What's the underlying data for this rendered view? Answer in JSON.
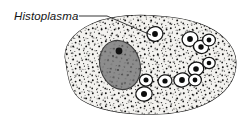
{
  "figure": {
    "kind": "biology-illustration",
    "background_color": "#ffffff"
  },
  "annotation": {
    "label": "Histoplasma",
    "label_style": "italic",
    "label_color": "#141414",
    "label_x": 14,
    "label_baseline_y": 20,
    "leader_line": {
      "name": "leader-line",
      "color": "#2a2a2a",
      "points": "79,16 107,16 151,35"
    }
  },
  "host_cell": {
    "name": "macrophage",
    "outline_color": "#1e1e1e",
    "fill_color": "#f2f1ee",
    "stipple_color": "#151515",
    "outline_path": "M 66,62 C 62,48 72,33 92,24 C 112,15 140,14 168,17 C 196,20 219,29 230,45 C 240,59 237,78 224,91 C 210,105 186,113 158,114 C 128,115 100,111 82,100 C 70,92 68,76 66,62 Z",
    "nucleus": {
      "name": "macrophage-nucleus",
      "fill_color": "#8d8d8d",
      "outline_color": "#3a3a3a",
      "cx": 120,
      "cy": 65,
      "rx": 20,
      "ry": 25,
      "rotation": -18,
      "nucleolus": {
        "cx": 119,
        "cy": 51,
        "r": 3.4,
        "color": "#121212"
      }
    }
  },
  "yeast_cells": {
    "name": "histoplasma-yeast-cells",
    "count": 11,
    "capsule_fill": "#ffffff",
    "capsule_outline": "#141414",
    "core_color": "#0c0c0c",
    "items": [
      {
        "id": "yeast-1-labeled",
        "cx": 155,
        "cy": 34,
        "rx": 8.0,
        "ry": 7.2,
        "rot": -12,
        "core_r": 2.9
      },
      {
        "id": "yeast-2",
        "cx": 190,
        "cy": 39,
        "rx": 8.0,
        "ry": 7.2,
        "rot": -20,
        "core_r": 2.9
      },
      {
        "id": "yeast-3",
        "cx": 201,
        "cy": 47,
        "rx": 7.6,
        "ry": 6.4,
        "rot": 15,
        "core_r": 2.7
      },
      {
        "id": "yeast-4",
        "cx": 209,
        "cy": 40,
        "rx": 6.4,
        "ry": 5.8,
        "rot": 0,
        "core_r": 2.4
      },
      {
        "id": "yeast-5",
        "cx": 196,
        "cy": 69,
        "rx": 7.8,
        "ry": 6.8,
        "rot": -15,
        "core_r": 2.8
      },
      {
        "id": "yeast-6",
        "cx": 209,
        "cy": 63,
        "rx": 6.2,
        "ry": 5.6,
        "rot": 0,
        "core_r": 2.3
      },
      {
        "id": "yeast-7",
        "cx": 165,
        "cy": 81,
        "rx": 7.0,
        "ry": 6.2,
        "rot": -10,
        "core_r": 2.6
      },
      {
        "id": "yeast-8",
        "cx": 182,
        "cy": 80,
        "rx": 8.2,
        "ry": 7.0,
        "rot": -10,
        "core_r": 2.9
      },
      {
        "id": "yeast-9",
        "cx": 195,
        "cy": 80,
        "rx": 6.4,
        "ry": 5.8,
        "rot": 0,
        "core_r": 2.4
      },
      {
        "id": "yeast-10",
        "cx": 146,
        "cy": 80,
        "rx": 6.6,
        "ry": 6.0,
        "rot": 0,
        "core_r": 2.5
      },
      {
        "id": "yeast-11",
        "cx": 144,
        "cy": 94,
        "rx": 8.2,
        "ry": 7.2,
        "rot": -8,
        "core_r": 3.0
      }
    ]
  }
}
